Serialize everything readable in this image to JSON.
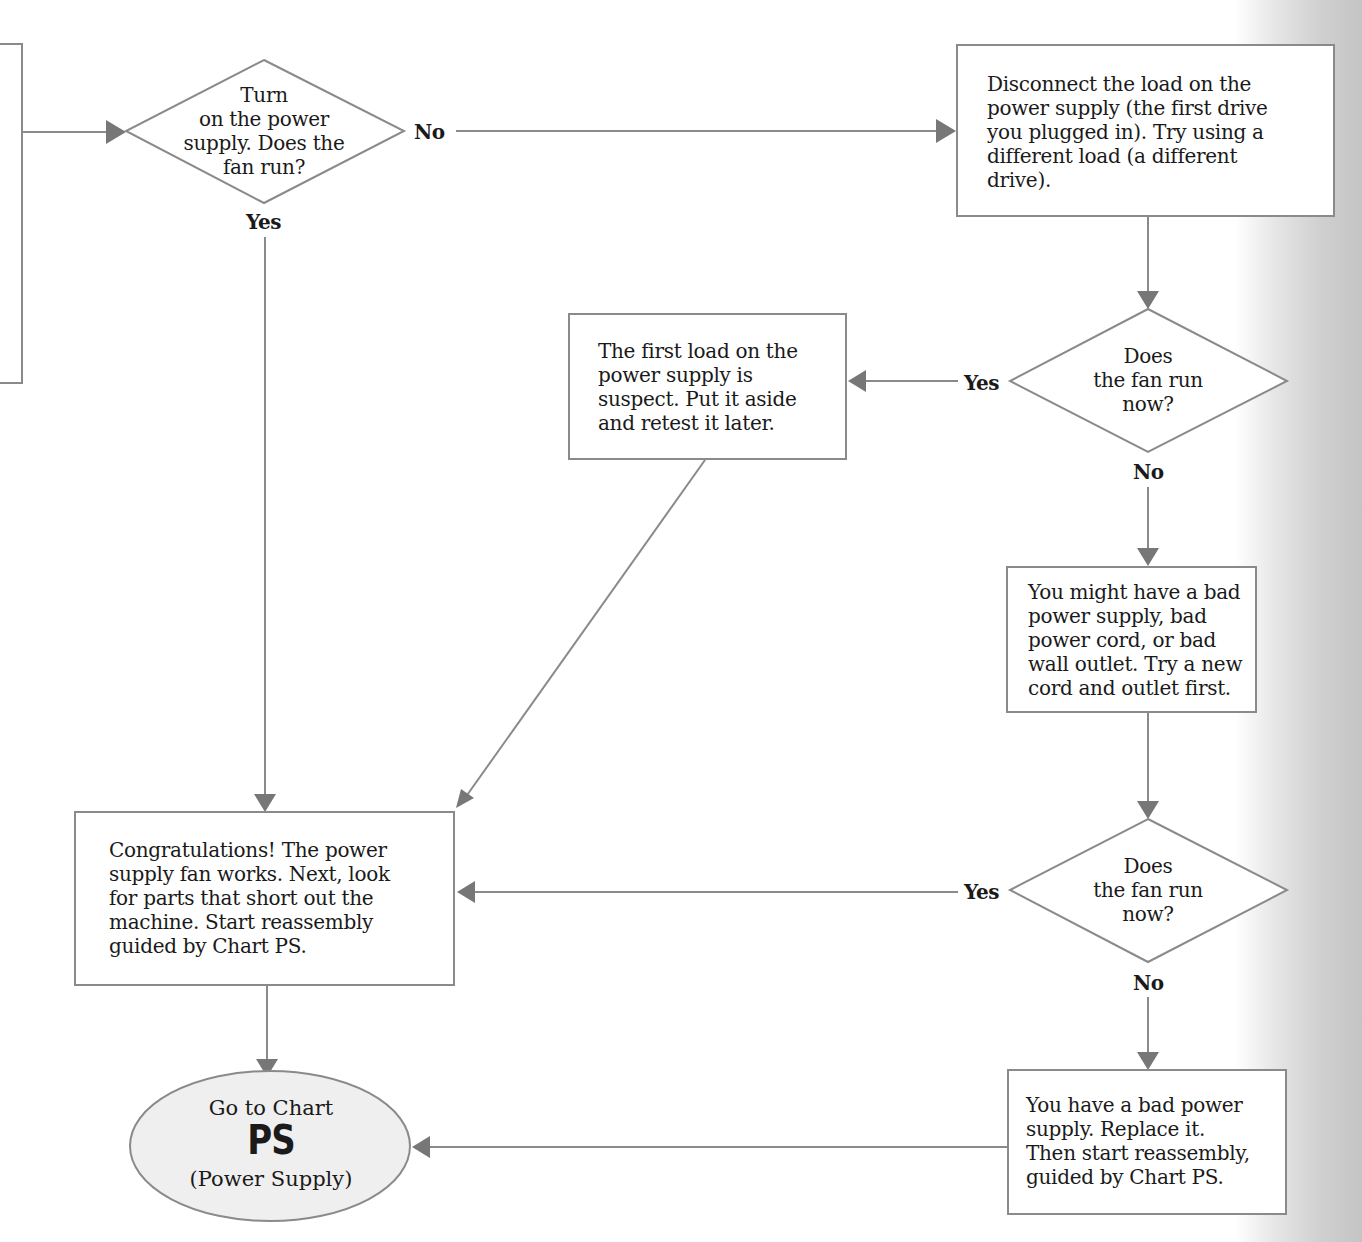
{
  "flowchart": {
    "colors": {
      "line": "#8a8a8a",
      "arrow": "#777777",
      "text": "#1a1a1a",
      "oval_fill": "#efefef",
      "page_shadow": "#c4c4c4"
    },
    "decision_start": {
      "text": "Turn\non the power\nsupply.  Does the\nfan run?",
      "no_label": "No",
      "yes_label": "Yes"
    },
    "box_disconnect": {
      "text": "Disconnect the load on the\npower supply (the first drive\nyou plugged in).  Try using a\ndifferent load (a different\ndrive)."
    },
    "decision_2": {
      "text": "Does\nthe fan run\nnow?",
      "yes_label": "Yes",
      "no_label": "No"
    },
    "box_first_load": {
      "text": "The first load on the\npower supply is\nsuspect.  Put it aside\nand retest it later."
    },
    "box_bad_supply_maybe": {
      "text": "You might have a bad\npower supply, bad\npower cord, or bad\nwall outlet.  Try a new\ncord and outlet first."
    },
    "decision_3": {
      "text": "Does\nthe fan run\nnow?",
      "yes_label": "Yes",
      "no_label": "No"
    },
    "box_congrats": {
      "text": "Congratulations!  The power\nsupply fan works.  Next, look\nfor parts that short out the\nmachine.  Start reassembly\nguided by Chart PS."
    },
    "box_bad_supply": {
      "text": "You have a bad power\nsupply.  Replace it.\nThen start reassembly,\nguided by Chart PS."
    },
    "terminal": {
      "line1": "Go to Chart",
      "code": "PS",
      "line3": "(Power Supply)"
    }
  }
}
